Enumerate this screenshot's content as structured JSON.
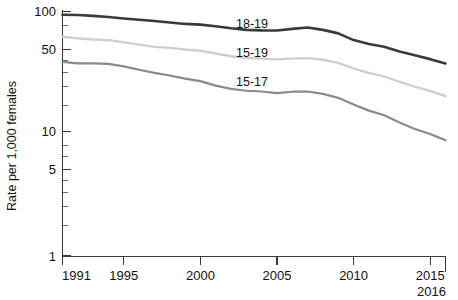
{
  "chart_data": {
    "type": "line",
    "title": "",
    "xlabel": "",
    "ylabel": "Rate per 1,000 females",
    "yscale": "log",
    "ylim": [
      1,
      100
    ],
    "xlim": [
      1991,
      2016
    ],
    "grid": false,
    "legend_position": "inline-labels",
    "ytick_labels": [
      "1",
      "5",
      "10",
      "50",
      "100"
    ],
    "ytick_values": [
      1,
      5,
      10,
      50,
      100
    ],
    "xtick_labels": [
      "1991",
      "1995",
      "2000",
      "2005",
      "2010",
      "2015",
      "2016"
    ],
    "xtick_values": [
      1991,
      1995,
      2000,
      2005,
      2010,
      2015,
      2016
    ],
    "x": [
      1991,
      1992,
      1993,
      1994,
      1995,
      1996,
      1997,
      1998,
      1999,
      2000,
      2001,
      2002,
      2003,
      2004,
      2005,
      2006,
      2007,
      2008,
      2009,
      2010,
      2011,
      2012,
      2013,
      2014,
      2015,
      2016
    ],
    "series": [
      {
        "name": "18-19",
        "label": "18-19",
        "color": "#3a3a3a",
        "values": [
          94.0,
          93.6,
          92.1,
          90.2,
          87.7,
          85.5,
          83.6,
          81.3,
          79.1,
          78.1,
          75.6,
          72.8,
          70.7,
          70.0,
          69.9,
          72.0,
          73.9,
          70.7,
          66.2,
          58.3,
          54.1,
          51.4,
          47.1,
          43.8,
          40.7,
          37.5
        ]
      },
      {
        "name": "15-19",
        "label": "15-19",
        "color": "#cfcfcf",
        "values": [
          61.8,
          60.3,
          59.0,
          58.2,
          56.0,
          53.5,
          51.3,
          50.3,
          48.8,
          47.7,
          45.3,
          43.0,
          41.6,
          41.1,
          40.5,
          41.1,
          41.5,
          40.2,
          37.9,
          34.2,
          31.3,
          29.4,
          26.5,
          24.2,
          22.3,
          20.3
        ]
      },
      {
        "name": "15-17",
        "label": "15-17",
        "color": "#8a8a8a",
        "values": [
          38.6,
          37.6,
          37.5,
          37.2,
          35.5,
          33.3,
          31.4,
          29.9,
          28.2,
          26.9,
          24.7,
          23.2,
          22.4,
          22.1,
          21.4,
          22.0,
          22.1,
          21.1,
          19.6,
          17.3,
          15.4,
          14.1,
          12.3,
          10.9,
          9.9,
          8.8
        ]
      }
    ],
    "annotations": [
      {
        "text": "18-19",
        "x": 2004.2,
        "y_px": 24
      },
      {
        "text": "15-19",
        "x": 2004.2,
        "y_px": 53
      },
      {
        "text": "15-17",
        "x": 2004.2,
        "y_px": 82
      }
    ]
  },
  "axes": {
    "y_label": "Rate per 1,000 females",
    "y_ticks": [
      {
        "label": "100"
      },
      {
        "label": "50"
      },
      {
        "label": "10"
      },
      {
        "label": "5"
      },
      {
        "label": "1"
      }
    ],
    "x_ticks": [
      {
        "label": "1991"
      },
      {
        "label": "1995"
      },
      {
        "label": "2000"
      },
      {
        "label": "2005"
      },
      {
        "label": "2010"
      },
      {
        "label": "2015"
      },
      {
        "label": "2016"
      }
    ]
  },
  "series_labels": {
    "s0": "18-19",
    "s1": "15-19",
    "s2": "15-17"
  }
}
